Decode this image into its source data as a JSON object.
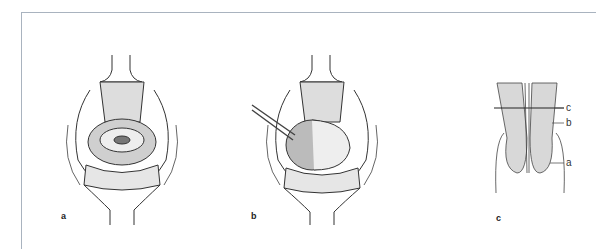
{
  "figure": {
    "panels": [
      {
        "id": "a",
        "label": "a",
        "description": "Surgical field view with retractors, central circular structure"
      },
      {
        "id": "b",
        "label": "b",
        "description": "Surgical field view with instrument inserted at left"
      },
      {
        "id": "c",
        "label": "c",
        "description": "Schematic cross-section with labeled levels",
        "callouts": [
          "c",
          "b",
          "a"
        ]
      }
    ]
  }
}
